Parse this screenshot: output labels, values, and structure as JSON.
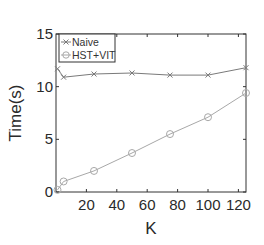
{
  "chart_data": {
    "type": "line",
    "title": "",
    "xlabel": "K",
    "ylabel": "Time(s)",
    "xlim": [
      0,
      125
    ],
    "ylim": [
      0,
      15
    ],
    "xticks": [
      20,
      40,
      60,
      80,
      100,
      120
    ],
    "yticks": [
      0,
      5,
      10,
      15
    ],
    "grid": false,
    "legend_position": "upper left",
    "series": [
      {
        "name": "Naive",
        "marker": "x",
        "color": "#7a7a7a",
        "x": [
          1,
          5,
          25,
          50,
          75,
          100,
          125
        ],
        "values": [
          11.7,
          10.9,
          11.2,
          11.3,
          11.1,
          11.1,
          11.8
        ]
      },
      {
        "name": "HST+VIT",
        "marker": "o",
        "color": "#a8a8a8",
        "x": [
          1,
          5,
          25,
          50,
          75,
          100,
          125
        ],
        "values": [
          0.2,
          1.0,
          2.0,
          3.7,
          5.5,
          7.1,
          9.4
        ]
      }
    ]
  },
  "axis": {
    "xlabel": "K",
    "ylabel": "Time(s)",
    "xtick_labels": [
      "20",
      "40",
      "60",
      "80",
      "100",
      "120"
    ],
    "ytick_labels": [
      "0",
      "5",
      "10",
      "15"
    ]
  },
  "legend": {
    "items": [
      {
        "label": "Naive"
      },
      {
        "label": "HST+VIT"
      }
    ]
  }
}
